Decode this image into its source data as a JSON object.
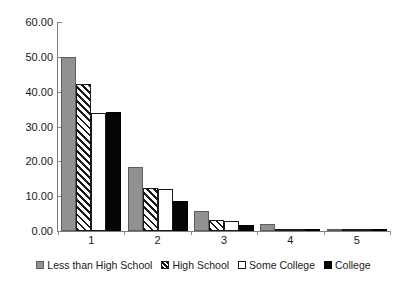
{
  "chart_data": {
    "type": "bar",
    "title": "",
    "subtitle": "",
    "xlabel": "",
    "ylabel": "",
    "categories": [
      "1",
      "2",
      "3",
      "4",
      "5"
    ],
    "ylim": [
      0,
      60
    ],
    "yticks": [
      0,
      10,
      20,
      30,
      40,
      50,
      60
    ],
    "ytick_labels": [
      "0.00",
      "10.00",
      "20.00",
      "30.00",
      "40.00",
      "50.00",
      "60.00"
    ],
    "grid": false,
    "legend_position": "bottom",
    "series": [
      {
        "name": "Less than High School",
        "fill": "solid-gray",
        "color": "#919191",
        "values": [
          50.0,
          18.4,
          5.8,
          2.0,
          0.1
        ]
      },
      {
        "name": "High School",
        "fill": "diagonal-hatch",
        "color": "#1a1a1a",
        "values": [
          42.3,
          12.4,
          3.2,
          0.4,
          0.0
        ]
      },
      {
        "name": "Some College",
        "fill": "white",
        "color": "#ffffff",
        "values": [
          33.8,
          12.1,
          3.0,
          0.7,
          0.0
        ]
      },
      {
        "name": "College",
        "fill": "solid-black",
        "color": "#050505",
        "values": [
          34.2,
          8.5,
          1.8,
          0.3,
          0.0
        ]
      }
    ]
  }
}
